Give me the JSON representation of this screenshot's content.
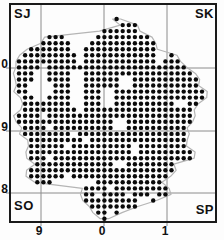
{
  "map": {
    "corner_labels": {
      "nw": "SJ",
      "ne": "SK",
      "sw": "SO",
      "se": "SP"
    },
    "frame": {
      "x": 10,
      "y": 4,
      "w": 206,
      "h": 218
    },
    "colors": {
      "background": "#fdfdfd",
      "frame": "#1a1a1a",
      "gridline": "#8c8c8c",
      "boundary": "#b5b5b5",
      "dot": "#0a0a0a",
      "text": "#111111"
    }
  },
  "chart_data": {
    "type": "scatter",
    "title": "",
    "grid_letters": [
      "SJ",
      "SK",
      "SO",
      "SP"
    ],
    "x_gridlines": [
      41,
      104,
      167
    ],
    "y_gridlines": [
      68,
      131,
      193
    ],
    "x_tick_labels": [
      {
        "text": "9",
        "line_x": 41
      },
      {
        "text": "0",
        "line_x": 104
      },
      {
        "text": "1",
        "line_x": 167
      }
    ],
    "y_tick_labels": [
      {
        "text": "0",
        "line_y": 68
      },
      {
        "text": "9",
        "line_y": 131
      },
      {
        "text": "8",
        "line_y": 193
      }
    ],
    "lattice": {
      "x0": 19,
      "y0": 19,
      "dx": 6.1,
      "dy": 6.05,
      "dot_radius": 2.2,
      "cols": 31,
      "rows": 34
    },
    "presence_rows": [
      "0000000000000000100000000000000",
      "0000000000000000011100000000000",
      "0000000000000011111100000000000",
      "0000011100000111111111000000000",
      "0000111110001111111111100000000",
      "0011111110011111111111100000000",
      "0111111111011111111111100100000",
      "1111111111011111111111101110000",
      "1111011111111111111111111111000",
      "1110011110011111111111111111100",
      "1110011110011111100111111111110",
      "1100001110011111100111111111110",
      "1100001110011100111111111111111",
      "0110011110011100111111111111111",
      "0111111110011100111111111100110",
      "0111111111011111111111111111100",
      "1111011111111111111111111111100",
      "1111111111111111001111111111100",
      "0111101111111111001111111111000",
      "0111111110111111111111111111000",
      "0011111111101111111111111111000",
      "0011111101111111111011111111000",
      "0011111111111111111011111111100",
      "0011101111111111111111111111100",
      "0001111111111111001111111100000",
      "0011111111111111111111111100000",
      "0011111101111111111111111000000",
      "0001110000000111111111110000000",
      "0000000000011110111111111000000",
      "0000000000011011110111011000000",
      "0000000000011111111100100000000",
      "0000000000001111111100000000000",
      "0000000000000110100000000000000",
      "0000000000000010000000000000000"
    ]
  }
}
